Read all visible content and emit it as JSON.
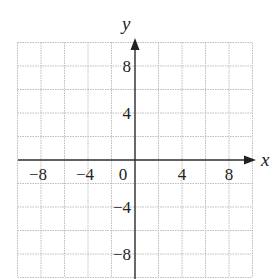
{
  "chart_data": {
    "type": "coordinate-grid",
    "title": "",
    "xlabel": "x",
    "ylabel": "y",
    "xlim": [
      -10,
      10
    ],
    "ylim": [
      -10,
      10
    ],
    "grid": true,
    "grid_step": 2,
    "grid_style": "dotted",
    "x_ticks": [
      {
        "value": -8,
        "label": "−8"
      },
      {
        "value": -4,
        "label": "−4"
      },
      {
        "value": 0,
        "label": "0"
      },
      {
        "value": 4,
        "label": "4"
      },
      {
        "value": 8,
        "label": "8"
      }
    ],
    "y_ticks": [
      {
        "value": 8,
        "label": "8"
      },
      {
        "value": 4,
        "label": "4"
      },
      {
        "value": -4,
        "label": "−4"
      },
      {
        "value": -8,
        "label": "−8"
      }
    ],
    "series": []
  },
  "colors": {
    "axis": "#333333",
    "grid": "#bdbdbd",
    "text": "#222222"
  }
}
